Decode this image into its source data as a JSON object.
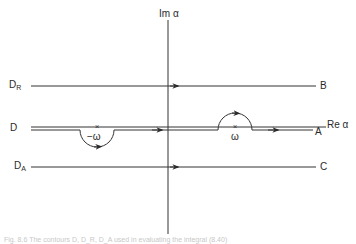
{
  "figure": {
    "axes": {
      "imaginary_label": "Im α",
      "real_label": "Re α"
    },
    "contours": [
      {
        "name": "D_R",
        "label_main": "D",
        "label_sub": "R",
        "end_label": "B",
        "type": "straight-above"
      },
      {
        "name": "D",
        "label_main": "D",
        "label_sub": "",
        "end_label": "A",
        "type": "indented-on-axis"
      },
      {
        "name": "D_A",
        "label_main": "D",
        "label_sub": "A",
        "end_label": "C",
        "type": "straight-below"
      }
    ],
    "poles": [
      {
        "label": "−ω",
        "position": "negative-real",
        "indent": "below"
      },
      {
        "label": "ω",
        "position": "positive-real",
        "indent": "above"
      }
    ],
    "caption": "Fig. 8.6  The contours D, D_R, D_A used in evaluating the integral (8.40)"
  }
}
